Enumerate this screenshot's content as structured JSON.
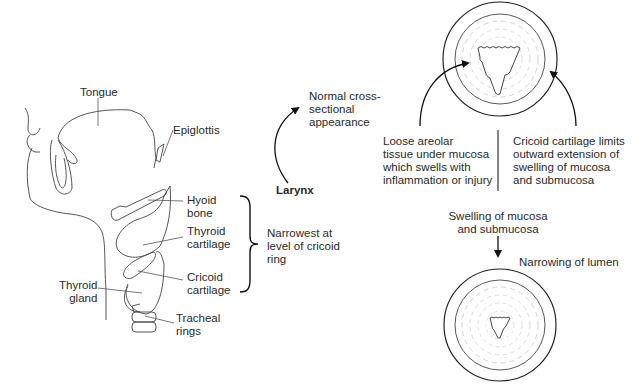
{
  "anatomy": {
    "labels": {
      "tongue": "Tongue",
      "epiglottis": "Epiglottis",
      "hyoid_bone": "Hyoid\nbone",
      "thyroid_cartilage": "Thyroid\ncartilage",
      "cricoid_cartilage": "Cricoid\ncartilage",
      "thyroid_gland": "Thyroid\ngland",
      "tracheal_rings": "Tracheal\nrings"
    },
    "bracket_note": "Narrowest at\nlevel of cricoid\nring"
  },
  "larynx": {
    "title": "Larynx",
    "arrow_target": "Normal cross-\nsectional\nappearance"
  },
  "cross_section": {
    "left_note": "Loose areolar\ntissue under mucosa\nwhich swells with\ninflammation or injury",
    "right_note": "Cricoid cartilage limits\noutward extension of\nswelling of mucosa\nand submucosa",
    "middle_note": "Swelling of mucosa\nand submucosa",
    "result_note": "Narrowing of lumen"
  }
}
